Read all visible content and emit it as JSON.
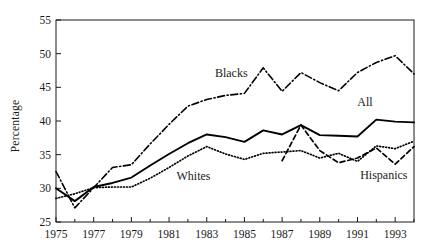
{
  "figure": {
    "ylabel": "Percentage",
    "background": "#ffffff",
    "ink": "#1a1a1a"
  },
  "chart_data": {
    "type": "line",
    "title": "",
    "xlabel": "",
    "ylabel": "Percentage",
    "xlim": [
      1975,
      1994
    ],
    "ylim": [
      25,
      55
    ],
    "grid": false,
    "legend": "inline-annotations",
    "xticks": [
      1975,
      1977,
      1979,
      1981,
      1983,
      1985,
      1987,
      1989,
      1991,
      1993
    ],
    "xtick_labels": [
      "1975",
      "1977",
      "1979",
      "1981",
      "1983",
      "1985",
      "1987",
      "1989",
      "1991",
      "1993"
    ],
    "yticks": [
      25,
      30,
      35,
      40,
      45,
      50,
      55
    ],
    "ytick_labels": [
      "25",
      "30",
      "35",
      "40",
      "45",
      "50",
      "55"
    ],
    "x": [
      1975,
      1976,
      1977,
      1978,
      1979,
      1980,
      1981,
      1982,
      1983,
      1984,
      1985,
      1986,
      1987,
      1988,
      1989,
      1990,
      1991,
      1992,
      1993,
      1994
    ],
    "series": [
      {
        "name": "All",
        "style": "solid",
        "label_annotation": "All",
        "values": [
          30.0,
          28.1,
          30.2,
          30.8,
          31.6,
          33.4,
          35.1,
          36.7,
          38.0,
          37.6,
          36.9,
          38.6,
          38.0,
          39.4,
          37.9,
          37.8,
          37.7,
          40.2,
          39.9,
          39.8
        ]
      },
      {
        "name": "Blacks",
        "style": "dash-dot",
        "label_annotation": "Blacks",
        "values": [
          32.5,
          27.1,
          30.1,
          33.1,
          33.5,
          36.6,
          39.5,
          42.2,
          43.2,
          43.8,
          44.1,
          47.9,
          44.4,
          47.2,
          45.7,
          44.5,
          47.2,
          48.7,
          49.7,
          47.0
        ]
      },
      {
        "name": "Whites",
        "style": "dotted",
        "label_annotation": "Whites",
        "values": [
          28.5,
          29.2,
          30.1,
          30.2,
          30.2,
          31.5,
          33.1,
          34.8,
          36.2,
          35.1,
          34.3,
          35.2,
          35.4,
          35.6,
          34.5,
          35.2,
          34.0,
          36.3,
          35.9,
          37.0
        ]
      },
      {
        "name": "Hispanics",
        "style": "dashed",
        "label_annotation": "Hispanics",
        "start_year": 1987,
        "values": [
          null,
          null,
          null,
          null,
          null,
          null,
          null,
          null,
          null,
          null,
          null,
          null,
          34.1,
          39.4,
          35.6,
          33.8,
          34.5,
          36.0,
          33.6,
          36.2
        ]
      }
    ],
    "annotations": [
      {
        "text": "Blacks",
        "x": 1984.3,
        "y": 46.6
      },
      {
        "text": "All",
        "x": 1991.4,
        "y": 42.3
      },
      {
        "text": "Whites",
        "x": 1982.3,
        "y": 31.3
      },
      {
        "text": "Hispanics",
        "x": 1992.4,
        "y": 31.4
      }
    ]
  }
}
